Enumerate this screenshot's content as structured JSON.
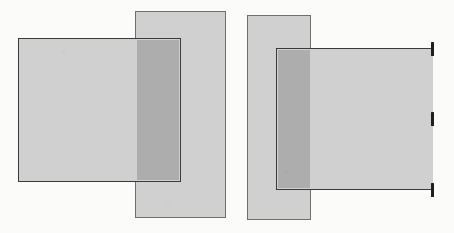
{
  "figure": {
    "background_color": "#fbfbfa",
    "width": 454,
    "height": 233,
    "panels": [
      {
        "id": "left",
        "name": "closed-region-panel",
        "description": "Two overlapping rectangles, both fully outlined; intersection shaded darker.",
        "shapes": [
          {
            "name": "vertical-band",
            "role": "band",
            "x": 135,
            "y": 11,
            "width": 91,
            "height": 207,
            "fill": "#d0d0d0",
            "stroke": "#6f6f6f",
            "stroke_width": 1
          },
          {
            "name": "horizontal-rectangle",
            "role": "rect",
            "x": 18,
            "y": 38,
            "width": 163,
            "height": 144,
            "fill": "#d0d0d0",
            "stroke": "#3a3a3a",
            "stroke_width": 1.6
          },
          {
            "name": "intersection-region",
            "role": "overlap",
            "x": 137,
            "y": 40,
            "width": 42,
            "height": 140,
            "fill": "#adadad"
          }
        ],
        "ticks": []
      },
      {
        "id": "right",
        "name": "open-region-panel",
        "description": "Same configuration, but the right edge of the horizontal rectangle is not drawn; three bold tick marks indicate where it would lie.",
        "shapes": [
          {
            "name": "vertical-band",
            "role": "band",
            "x": 247,
            "y": 15,
            "width": 64,
            "height": 205,
            "fill": "#d0d0d0",
            "stroke": "#6f6f6f",
            "stroke_width": 1
          },
          {
            "name": "horizontal-rectangle-open",
            "role": "rect-open",
            "x": 276,
            "y": 48,
            "width": 157,
            "height": 142,
            "fill": "#d0d0d0",
            "stroke": "#3a3a3a",
            "stroke_width": 1.6
          },
          {
            "name": "intersection-region",
            "role": "overlap",
            "x": 278,
            "y": 50,
            "width": 32,
            "height": 138,
            "fill": "#adadad"
          }
        ],
        "ticks": [
          {
            "name": "boundary-tick-top",
            "x": 431,
            "y": 42,
            "height": 14,
            "color": "#1e1e1e"
          },
          {
            "name": "boundary-tick-middle",
            "x": 431,
            "y": 112,
            "height": 14,
            "color": "#1e1e1e"
          },
          {
            "name": "boundary-tick-bottom",
            "x": 431,
            "y": 183,
            "height": 14,
            "color": "#1e1e1e"
          }
        ]
      }
    ]
  }
}
